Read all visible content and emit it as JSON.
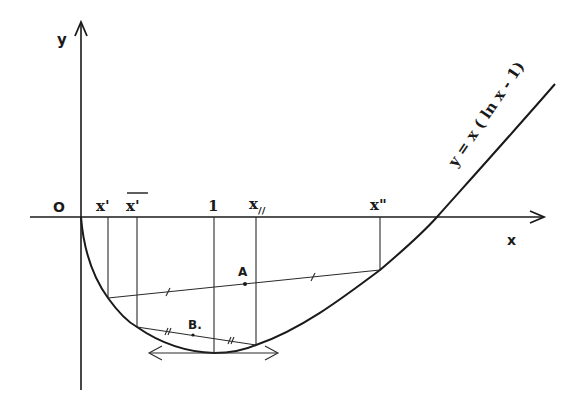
{
  "diagram": {
    "type": "function-graph",
    "axes": {
      "x_label": "x",
      "y_label": "y",
      "origin_label": "O"
    },
    "curve": {
      "equation_label": "y = x ( ln x - 1)"
    },
    "x_marks": {
      "x_prime": "x'",
      "x_bar_prime": "x'",
      "one": "1",
      "x_double_slash": "x",
      "x_double_slash_sub": "//",
      "x_double_prime": "x\""
    },
    "points": {
      "A": "A",
      "B": "B."
    },
    "colors": {
      "ink": "#1a1a1a",
      "background": "#ffffff"
    }
  }
}
